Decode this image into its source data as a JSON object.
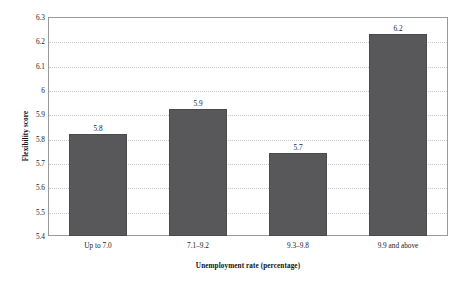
{
  "chart_data": {
    "type": "bar",
    "title": "",
    "subtitle": "",
    "xlabel": "Unemployment rate (percentage)",
    "ylabel": "Flexibility score",
    "categories": [
      "Up to 7.0",
      "7.1–9.2",
      "9.3–9.8",
      "9.9 and above"
    ],
    "values": [
      5.82,
      5.92,
      5.74,
      6.23
    ],
    "data_labels": [
      "5.8",
      "5.9",
      "5.7",
      "6.2"
    ],
    "ylim": [
      5.4,
      6.3
    ],
    "ytick_labels": [
      "6.3",
      "6.2",
      "6.1",
      "6",
      "5.9",
      "5.8",
      "5.7",
      "5.6",
      "5.5",
      "5.4"
    ],
    "ytick_values": [
      6.3,
      6.2,
      6.1,
      6.0,
      5.9,
      5.8,
      5.7,
      5.6,
      5.5,
      5.4
    ],
    "grid": true,
    "grid_style": "dotted",
    "legend": "none",
    "bar_color": "#58585a",
    "grid_color": "#c9c9c9",
    "frame_color": "#9a9a9a",
    "text_color": "#1a1a1a",
    "background": "#ffffff"
  }
}
